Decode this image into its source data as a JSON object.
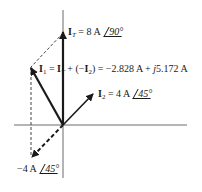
{
  "diagram": {
    "type": "phasor-diagram",
    "colors": {
      "line": "#1a1a1a",
      "axis": "#555555",
      "dashed": "#444444",
      "background": "#ffffff"
    },
    "labels": {
      "it": {
        "symbol": "I",
        "subscript": "T",
        "equals": " = 8 A ",
        "angle": "90°"
      },
      "i1": {
        "symbol": "I",
        "subscript": "1",
        "expr_mid": " = ",
        "symbol2": "I",
        "subscript2": "T",
        "expr_plus": " + (−",
        "symbol3": "I",
        "subscript3": "2",
        "expr_tail": ") = −2.828 A + ",
        "j": "j",
        "imag": "5.172 A"
      },
      "i2": {
        "symbol": "I",
        "subscript": "2",
        "equals": " = 4 A ",
        "angle": "45°"
      },
      "neg_i2": {
        "value": "−4 A ",
        "angle": "45°"
      }
    },
    "phasors": [
      {
        "name": "I_T",
        "magnitude": "8 A",
        "angle_deg": 90,
        "style": "solid"
      },
      {
        "name": "I_1",
        "rectangular": "-2.828 A + j5.172 A",
        "style": "solid"
      },
      {
        "name": "I_2",
        "magnitude": "4 A",
        "angle_deg": 45,
        "style": "solid"
      },
      {
        "name": "-I_2",
        "magnitude": "-4 A",
        "angle_deg": 45,
        "style": "dashed"
      }
    ]
  }
}
